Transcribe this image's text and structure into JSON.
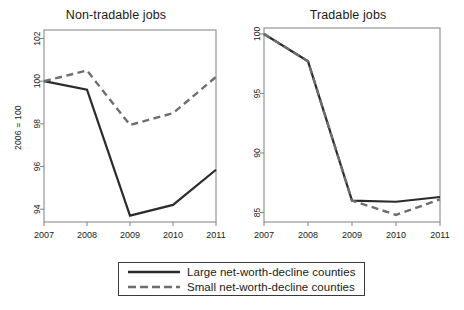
{
  "figure": {
    "width": 464,
    "height": 310,
    "background": "#ffffff",
    "line_color": "#2b2b2b",
    "dashed_color": "#6e6e6e",
    "axis_color": "#808080"
  },
  "legend": {
    "entries": [
      {
        "label": "Large net-worth-decline counties",
        "style": "solid",
        "color": "#2b2b2b"
      },
      {
        "label": "Small net-worth-decline counties",
        "style": "dashed",
        "color": "#6e6e6e"
      }
    ]
  },
  "chart_data": [
    {
      "type": "line",
      "title": "Non-tradable jobs",
      "xlabel": "",
      "ylabel": "2006 = 100",
      "x": [
        "2007",
        "2008",
        "2009",
        "2010",
        "2011"
      ],
      "xlim": [
        2007,
        2011
      ],
      "ylim": [
        93.4,
        102.4
      ],
      "yticks": [
        94,
        96,
        98,
        100,
        102
      ],
      "grid": false,
      "legend_position": "below-figure",
      "series": [
        {
          "name": "Large net-worth-decline counties",
          "style": "solid",
          "color": "#2b2b2b",
          "values": [
            100.0,
            99.6,
            93.7,
            94.2,
            95.85
          ]
        },
        {
          "name": "Small net-worth-decline counties",
          "style": "dashed",
          "color": "#6e6e6e",
          "values": [
            100.0,
            100.5,
            97.95,
            98.5,
            100.2
          ]
        }
      ]
    },
    {
      "type": "line",
      "title": "Tradable jobs",
      "xlabel": "",
      "ylabel": "2006 = 100",
      "x": [
        "2007",
        "2008",
        "2009",
        "2010",
        "2011"
      ],
      "xlim": [
        2007,
        2011
      ],
      "ylim": [
        84.2,
        100.5
      ],
      "yticks": [
        85,
        90,
        95,
        100
      ],
      "grid": false,
      "legend_position": "below-figure",
      "series": [
        {
          "name": "Large net-worth-decline counties",
          "style": "solid",
          "color": "#2b2b2b",
          "values": [
            100.0,
            97.7,
            86.0,
            85.9,
            86.3
          ]
        },
        {
          "name": "Small net-worth-decline counties",
          "style": "dashed",
          "color": "#6e6e6e",
          "values": [
            100.0,
            97.7,
            86.0,
            84.8,
            86.1
          ]
        }
      ]
    }
  ]
}
